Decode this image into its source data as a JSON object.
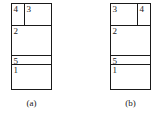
{
  "figure": {
    "type": "partition-diagram-pair",
    "line_color": "#1a1a1a",
    "background_color": "#ffffff",
    "panels": [
      {
        "caption": "(a)",
        "regions": [
          {
            "label": "4",
            "position": "top-left-narrow"
          },
          {
            "label": "3",
            "position": "top-right-wide"
          },
          {
            "label": "2",
            "position": "upper-middle-full-width"
          },
          {
            "label": "5",
            "position": "lower-middle-thin-full-width"
          },
          {
            "label": "1",
            "position": "bottom-full-width"
          }
        ]
      },
      {
        "caption": "(b)",
        "regions": [
          {
            "label": "3",
            "position": "top-left-wide"
          },
          {
            "label": "4",
            "position": "top-right-narrow"
          },
          {
            "label": "2",
            "position": "upper-middle-full-width"
          },
          {
            "label": "5",
            "position": "lower-middle-thin-full-width"
          },
          {
            "label": "1",
            "position": "bottom-full-width"
          }
        ]
      }
    ]
  }
}
